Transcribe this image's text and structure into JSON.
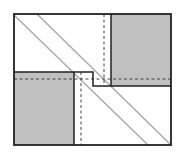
{
  "diagram": {
    "width": 178,
    "height": 156,
    "colors": {
      "background": "#ffffff",
      "fill": "#c0c0c0",
      "outline": "#222222",
      "diagonal": "#a8a8a8",
      "dashed": "#444444"
    },
    "frame": {
      "x": 14,
      "y": 14,
      "w": 157,
      "h": 131
    },
    "shaded_blocks": [
      {
        "name": "top-right-block",
        "x": 111,
        "y": 14,
        "w": 60,
        "h": 72
      },
      {
        "name": "bottom-left-block",
        "x": 14,
        "y": 72,
        "w": 60,
        "h": 73
      }
    ],
    "step_path": "M14 72 L93 72 L93 86 L171 86",
    "diagonals": [
      {
        "x1": 14,
        "y1": 15,
        "x2": 148,
        "y2": 145
      },
      {
        "x1": 37,
        "y1": 14,
        "x2": 171,
        "y2": 145
      }
    ],
    "dashed_lines": [
      {
        "name": "horizontal-fold",
        "x1": 14,
        "y1": 79,
        "x2": 171,
        "y2": 79
      },
      {
        "name": "upper-vertical-fold",
        "x1": 104,
        "y1": 14,
        "x2": 104,
        "y2": 86
      },
      {
        "name": "lower-vertical-fold",
        "x1": 81,
        "y1": 72,
        "x2": 81,
        "y2": 145
      }
    ]
  }
}
